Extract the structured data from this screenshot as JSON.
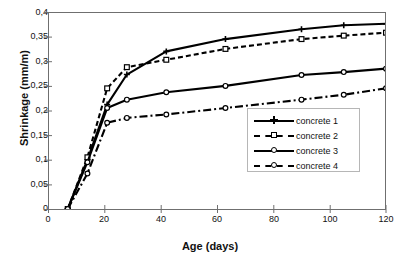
{
  "chart_data": {
    "type": "line",
    "title": "",
    "xlabel": "Age (days)",
    "ylabel": "Shrinkage (mm/m)",
    "xlim": [
      0,
      120
    ],
    "ylim": [
      0,
      0.4
    ],
    "xticks": [
      "0",
      "20",
      "40",
      "60",
      "80",
      "100",
      "120"
    ],
    "xtick_values": [
      0,
      20,
      40,
      60,
      80,
      100,
      120
    ],
    "yticks": [
      "0",
      "0,05",
      "0,1",
      "0,15",
      "0,2",
      "0,25",
      "0,3",
      "0,35",
      "0,4"
    ],
    "ytick_values": [
      0,
      0.05,
      0.1,
      0.15,
      0.2,
      0.25,
      0.3,
      0.35,
      0.4
    ],
    "grid": false,
    "legend_position": "center-right",
    "decimal_separator": ",",
    "series": [
      {
        "name": "concrete 1",
        "line_style": "solid",
        "marker": "plus",
        "color": "#000000",
        "x": [
          7,
          14,
          21,
          28,
          42,
          63,
          90,
          105,
          120
        ],
        "y": [
          0.0,
          0.1,
          0.212,
          0.273,
          0.32,
          0.345,
          0.365,
          0.373,
          0.376
        ]
      },
      {
        "name": "concrete 2",
        "line_style": "dashed",
        "marker": "square",
        "color": "#000000",
        "x": [
          7,
          14,
          21,
          28,
          42,
          63,
          90,
          105,
          120
        ],
        "y": [
          0.0,
          0.105,
          0.245,
          0.288,
          0.303,
          0.325,
          0.345,
          0.352,
          0.358
        ]
      },
      {
        "name": "concrete 3",
        "line_style": "solid",
        "marker": "circle",
        "color": "#000000",
        "x": [
          7,
          14,
          21,
          28,
          42,
          63,
          90,
          105,
          120
        ],
        "y": [
          0.0,
          0.095,
          0.205,
          0.222,
          0.237,
          0.25,
          0.272,
          0.278,
          0.285
        ]
      },
      {
        "name": "concrete 4",
        "line_style": "dashdot",
        "marker": "circle",
        "color": "#000000",
        "x": [
          7,
          14,
          21,
          28,
          42,
          63,
          90,
          105,
          120
        ],
        "y": [
          0.0,
          0.072,
          0.175,
          0.185,
          0.192,
          0.205,
          0.222,
          0.232,
          0.245
        ]
      }
    ]
  },
  "legend": {
    "entries": [
      {
        "label": "concrete 1"
      },
      {
        "label": "concrete 2"
      },
      {
        "label": "concrete 3"
      },
      {
        "label": "concrete 4"
      }
    ]
  }
}
